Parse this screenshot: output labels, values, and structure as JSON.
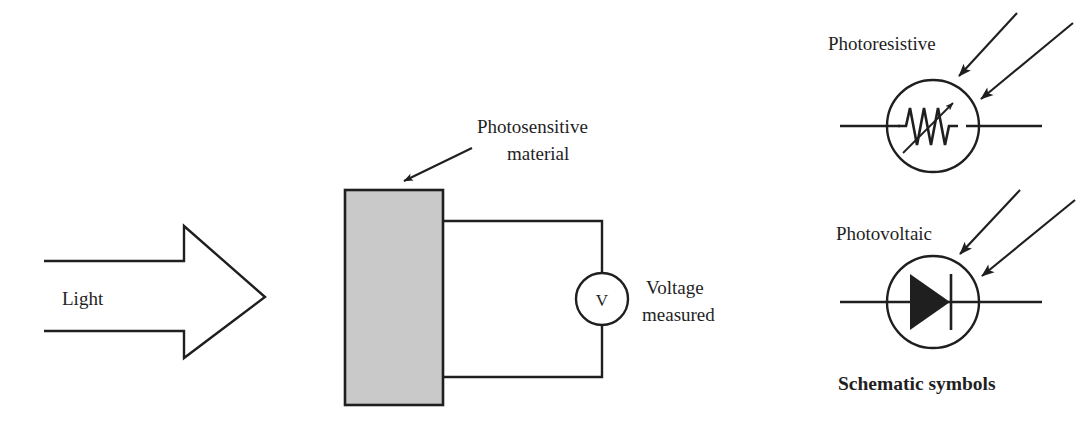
{
  "figure": {
    "title_hidden": "Photodetector operating principle and schematic symbols",
    "background_color": "#ffffff",
    "ink_color": "#1f1f1f",
    "block_fill_color": "#c9c9c9"
  },
  "left_panel": {
    "light_arrow": {
      "label": "Light",
      "icon": "block-arrow-right",
      "direction": "right",
      "filled": false,
      "tip_x": 265,
      "tip_y": 297
    },
    "photosensitive_block": {
      "label_line1": "Photosensitive",
      "label_line2": "material",
      "pointer_icon": "callout-arrow-down-left",
      "fill": "#c9c9c9",
      "x": 345,
      "y": 190,
      "width": 98,
      "height": 215
    },
    "meter": {
      "symbol": "V",
      "icon": "voltmeter-circle",
      "label_line1": "Voltage",
      "label_line2": "measured",
      "center_x": 602,
      "center_y": 299,
      "radius": 26
    }
  },
  "right_panel": {
    "caption": "Schematic symbols",
    "symbols": [
      {
        "name": "photoresistive",
        "label": "Photoresistive",
        "icon": "variable-resistor-in-circle",
        "center_x": 933,
        "center_y": 126,
        "radius": 46,
        "light_arrows": 2
      },
      {
        "name": "photovoltaic",
        "label": "Photovoltaic",
        "icon": "diode-in-circle",
        "center_x": 933,
        "center_y": 302,
        "radius": 46,
        "light_arrows": 2
      }
    ]
  }
}
